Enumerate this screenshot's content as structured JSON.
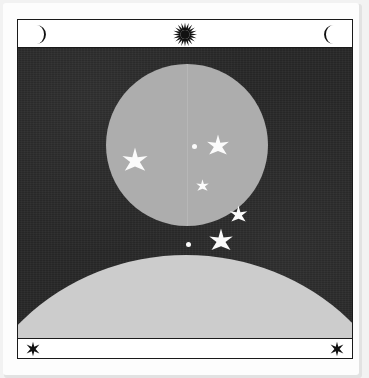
{
  "artwork": {
    "title": "Southern Cross Night Sky Plate",
    "medium": "printed card",
    "palette": {
      "page_background": "#f2f2f2",
      "card": "#fdfdfd",
      "frame_line": "#1a1a1a",
      "band": "#ffffff",
      "night_sky": "#262626",
      "moon_disc": "#adadad",
      "horizon": "#cccccc",
      "star_fill": "#fbfbfb"
    }
  },
  "frame": {
    "top_band": {
      "icons": [
        {
          "name": "crescent-moon-left",
          "glyph": "☽",
          "orientation": "opens-left",
          "color": "#111111"
        },
        {
          "name": "sunburst-center",
          "glyph": "✳",
          "points": 20,
          "color": "#111111"
        },
        {
          "name": "crescent-moon-right",
          "glyph": "☾",
          "orientation": "opens-right",
          "color": "#111111"
        }
      ]
    },
    "bottom_band": {
      "icons": [
        {
          "name": "six-point-star-left",
          "glyph": "✱",
          "points": 6,
          "color": "#111111"
        },
        {
          "name": "six-point-star-right",
          "glyph": "✱",
          "points": 6,
          "color": "#111111"
        }
      ]
    }
  },
  "scene": {
    "label": "night-sky-scene",
    "moon": {
      "label": "moon-disc",
      "center_x_pct": 51.0,
      "center_y_pct": 33.0,
      "diameter_px": 162,
      "seam": true
    },
    "horizon": {
      "label": "planet-horizon-arc",
      "peak_y_px": 207,
      "width_px": 460
    },
    "stars": [
      {
        "name": "star-crux-epsilon-dot",
        "points": 0,
        "size": 5,
        "x": 176,
        "y": 98,
        "shape": "dot"
      },
      {
        "name": "star-crux-gamma",
        "points": 7,
        "size": 26,
        "x": 200,
        "y": 99,
        "shape": "star"
      },
      {
        "name": "star-commonwealth",
        "points": 7,
        "size": 30,
        "x": 117,
        "y": 114,
        "shape": "star"
      },
      {
        "name": "star-crux-epsilon",
        "points": 5,
        "size": 15,
        "x": 184,
        "y": 138,
        "shape": "star"
      },
      {
        "name": "star-crux-beta",
        "points": 7,
        "size": 21,
        "x": 220,
        "y": 167,
        "shape": "star"
      },
      {
        "name": "star-crux-delta-dot",
        "points": 0,
        "size": 5,
        "x": 170,
        "y": 196,
        "shape": "dot"
      },
      {
        "name": "star-crux-alpha",
        "points": 7,
        "size": 28,
        "x": 203,
        "y": 194,
        "shape": "star"
      }
    ]
  }
}
